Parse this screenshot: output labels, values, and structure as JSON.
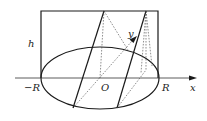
{
  "diagram": {
    "labels": {
      "h": "h",
      "neg_r": "−R",
      "origin": "O",
      "r": "R",
      "x_axis": "x",
      "y_axis": "y"
    },
    "colors": {
      "stroke": "#1a1a1a",
      "background": "#ffffff"
    }
  }
}
